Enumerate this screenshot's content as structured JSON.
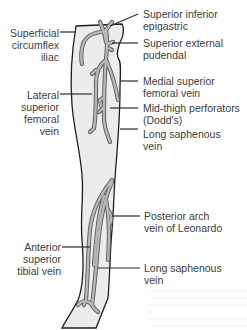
{
  "figure": {
    "colors": {
      "leg_fill": "#ececec",
      "leg_outline": "#1e1e1e",
      "vein_fill": "#b8b8b8",
      "vein_outline": "#5a5a5a",
      "text": "#3c3c3c"
    }
  },
  "labels": {
    "left": [
      {
        "id": "superficial-circumflex-iliac",
        "lines": [
          "Superficial",
          "circumflex",
          "iliac"
        ]
      },
      {
        "id": "lateral-superior-femoral-vein",
        "lines": [
          "Lateral",
          "superior",
          "femoral",
          "vein"
        ]
      },
      {
        "id": "anterior-superior-tibial-vein",
        "lines": [
          "Anterior",
          "superior",
          "tibial vein"
        ]
      }
    ],
    "right": [
      {
        "id": "superior-inferior-epigastric",
        "lines": [
          "Superior inferior",
          "epigastric"
        ]
      },
      {
        "id": "superior-external-pudendal",
        "lines": [
          "Superior external",
          "pudendal"
        ]
      },
      {
        "id": "medial-superior-femoral-vein",
        "lines": [
          "Medial superior",
          "femoral vein"
        ]
      },
      {
        "id": "mid-thigh-perforators",
        "lines": [
          "Mid-thigh perforators",
          "(Dodd's)"
        ]
      },
      {
        "id": "long-saphenous-vein-upper",
        "lines": [
          "Long saphenous",
          "vein"
        ]
      },
      {
        "id": "posterior-arch-vein",
        "lines": [
          "Posterior arch",
          "vein of Leonardo"
        ]
      },
      {
        "id": "long-saphenous-vein-lower",
        "lines": [
          "Long saphenous",
          "vein"
        ]
      }
    ]
  }
}
